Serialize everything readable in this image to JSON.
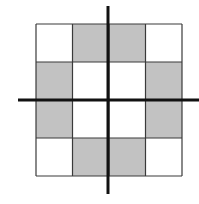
{
  "diagram": {
    "type": "symmetric-checker-grid",
    "grid": {
      "rows": 4,
      "cols": 4,
      "x": 36,
      "y": 24,
      "width": 146,
      "height": 152,
      "border_color": "#3a3a3a",
      "pattern": [
        [
          "white",
          "gray",
          "gray",
          "white"
        ],
        [
          "gray",
          "white",
          "white",
          "gray"
        ],
        [
          "gray",
          "white",
          "white",
          "gray"
        ],
        [
          "white",
          "gray",
          "gray",
          "white"
        ]
      ]
    },
    "colors": {
      "gray": "#c2c2c2",
      "white": "#ffffff",
      "axis": "#111111"
    },
    "axes": {
      "vertical": {
        "x": 108,
        "y1": 6,
        "y2": 194,
        "stroke_width": 3
      },
      "horizontal": {
        "y": 100,
        "x1": 18,
        "x2": 199,
        "stroke_width": 3
      }
    }
  }
}
